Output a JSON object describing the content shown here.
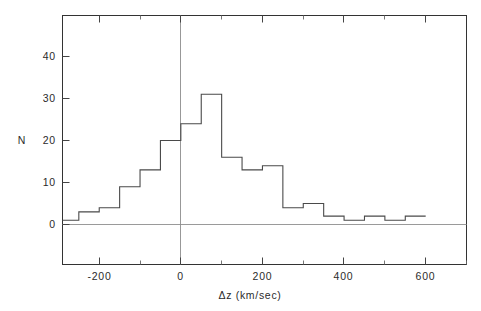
{
  "chart_data": {
    "type": "bar",
    "title": "",
    "subtitle": "",
    "xlabel": "Δz (km/sec)",
    "ylabel": "N",
    "xlim": [
      -290,
      700
    ],
    "ylim": [
      -12,
      49
    ],
    "grid": false,
    "legend": null,
    "bin_width": 50,
    "x_ticks": [
      -200,
      0,
      200,
      400,
      600
    ],
    "x_tick_labels": [
      "-200",
      "0",
      "200",
      "400",
      "600"
    ],
    "x_minor_ticks": [
      -250,
      -150,
      -100,
      -50,
      50,
      100,
      150,
      250,
      300,
      350,
      450,
      500,
      550,
      650
    ],
    "y_ticks": [
      0,
      10,
      20,
      30,
      40
    ],
    "y_tick_labels": [
      "0",
      "10",
      "20",
      "30",
      "40"
    ],
    "bin_edges": [
      -290,
      -250,
      -200,
      -150,
      -100,
      -50,
      0,
      50,
      100,
      150,
      200,
      250,
      300,
      350,
      400,
      450,
      500,
      550,
      600
    ],
    "categories": [
      "-290 to -250",
      "-250 to -200",
      "-200 to -150",
      "-150 to -100",
      "-100 to -50",
      "-50 to 0",
      "0 to 50",
      "50 to 100",
      "100 to 150",
      "150 to 200",
      "200 to 250",
      "250 to 300",
      "300 to 350",
      "350 to 400",
      "400 to 450",
      "450 to 500",
      "500 to 550",
      "550 to 600"
    ],
    "values": [
      1,
      3,
      4,
      9,
      13,
      20,
      24,
      31,
      16,
      13,
      14,
      4,
      5,
      2,
      1,
      2,
      1,
      2
    ],
    "annotations": [],
    "colors": {
      "line": "#4a4a4a",
      "frame": "#333333",
      "zero_line": "#9a9a9a",
      "vertical_marker": "#8c8c8c",
      "background": "#ffffff"
    },
    "vertical_marker_x": 0
  },
  "figure": {
    "caption": ""
  }
}
